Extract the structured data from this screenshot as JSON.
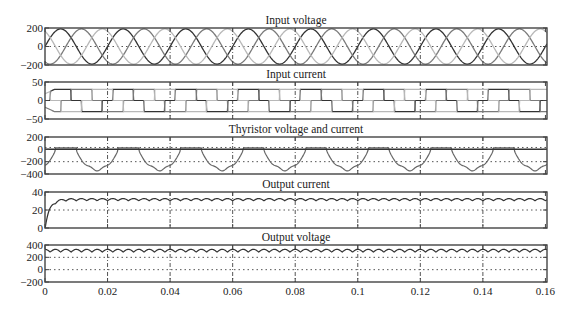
{
  "chart_data": [
    {
      "type": "line",
      "title": "Input voltage",
      "xlabel": "",
      "ylabel": "",
      "ylim": [
        -200,
        200
      ],
      "yticks": [
        "200",
        "0",
        "-200"
      ],
      "yticks_values": [
        200,
        0,
        -200
      ],
      "grid_y": [
        0
      ],
      "series": [
        {
          "name": "Phase a",
          "shape": "sine",
          "amplitude": 190,
          "frequency_hz": 50,
          "phase_deg": 0,
          "color": "#333333"
        },
        {
          "name": "Phase b",
          "shape": "sine",
          "amplitude": 190,
          "frequency_hz": 50,
          "phase_deg": -120,
          "color": "#7a7a7a"
        },
        {
          "name": "Phase c",
          "shape": "sine",
          "amplitude": 190,
          "frequency_hz": 50,
          "phase_deg": 120,
          "color": "#b8b8b8"
        }
      ]
    },
    {
      "type": "line",
      "title": "Input current",
      "xlabel": "",
      "ylabel": "",
      "ylim": [
        -50,
        50
      ],
      "yticks": [
        "50",
        "0",
        "-50"
      ],
      "yticks_values": [
        50,
        0,
        -50
      ],
      "grid_y": [],
      "series": [
        {
          "name": "Phase a current",
          "shape": "quasi-square 120deg",
          "amplitude": 30,
          "frequency_hz": 50,
          "color": "#333333"
        },
        {
          "name": "Phase b current",
          "shape": "quasi-square 120deg",
          "amplitude": 30,
          "frequency_hz": 50,
          "color": "#7a7a7a"
        },
        {
          "name": "Phase c current",
          "shape": "quasi-square 120deg",
          "amplitude": 30,
          "frequency_hz": 50,
          "color": "#b8b8b8"
        }
      ]
    },
    {
      "type": "line",
      "title": "Thyristor voltage and current",
      "xlabel": "",
      "ylabel": "",
      "ylim": [
        -400,
        200
      ],
      "yticks": [
        "200",
        "0",
        "-200",
        "-400"
      ],
      "yticks_values": [
        200,
        0,
        -200,
        -400
      ],
      "grid_y": [
        30,
        -200
      ],
      "series": [
        {
          "name": "Thyristor voltage",
          "shape": "blocking voltage, min ~ -330",
          "min": -330,
          "frequency_hz": 50,
          "color": "#666666"
        },
        {
          "name": "Thyristor current",
          "shape": "pulse ~30 during conduction",
          "max": 30,
          "color": "#333333"
        }
      ]
    },
    {
      "type": "line",
      "title": "Output current",
      "xlabel": "",
      "ylabel": "",
      "ylim": [
        0,
        40
      ],
      "yticks": [
        "40",
        "20",
        "0"
      ],
      "yticks_values": [
        40,
        20,
        0
      ],
      "grid_y": [
        20
      ],
      "series": [
        {
          "name": "Output current",
          "shape": "rise then ripple",
          "steady_mean": 31.5,
          "ripple": 1.2,
          "ripple_hz": 300,
          "color": "#333333"
        }
      ]
    },
    {
      "type": "line",
      "title": "Output voltage",
      "xlabel": "",
      "ylabel": "",
      "ylim": [
        -200,
        400
      ],
      "yticks": [
        "400",
        "200",
        "0",
        "-200"
      ],
      "yticks_values": [
        400,
        200,
        0,
        -200
      ],
      "grid_y": [
        200,
        0
      ],
      "series": [
        {
          "name": "Output voltage",
          "shape": "6-pulse ripple",
          "max": 330,
          "min": 285,
          "ripple_hz": 300,
          "color": "#333333"
        }
      ]
    }
  ],
  "x_axis": {
    "xlim": [
      0,
      0.1605
    ],
    "ticks": [
      "0",
      "0.02",
      "0.04",
      "0.06",
      "0.08",
      "0.1",
      "0.12",
      "0.14",
      "0.16"
    ],
    "tick_values": [
      0,
      0.02,
      0.04,
      0.06,
      0.08,
      0.1,
      0.12,
      0.14,
      0.16
    ],
    "grid_x": [
      0.02,
      0.04,
      0.06,
      0.08,
      0.1,
      0.12,
      0.14
    ]
  },
  "colors": {
    "frame": "#444444",
    "grid": "#555555",
    "text": "#222222"
  }
}
